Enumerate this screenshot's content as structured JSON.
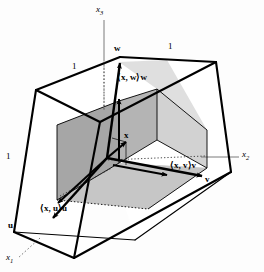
{
  "figure": {
    "axes": [
      {
        "name": "x3-axis-label",
        "text": "x₃",
        "base": "x",
        "sub": "3"
      },
      {
        "name": "x2-axis-label",
        "text": "x₂",
        "base": "x",
        "sub": "2"
      },
      {
        "name": "x1-axis-label",
        "text": "x₁",
        "base": "x",
        "sub": "1"
      }
    ],
    "basis_vectors": [
      {
        "name": "w",
        "label": "w"
      },
      {
        "name": "v",
        "label": "v"
      },
      {
        "name": "u",
        "label": "u"
      }
    ],
    "vector_label": "x",
    "components": [
      {
        "name": "component-w",
        "label": "⟨x, w⟩w"
      },
      {
        "name": "component-v",
        "label": "⟨x, v⟩v"
      },
      {
        "name": "component-u",
        "label": "⟨x, u⟩u"
      }
    ],
    "edge_lengths": [
      {
        "name": "edge-length-top-left",
        "label": "1"
      },
      {
        "name": "edge-length-top-right",
        "label": "1"
      },
      {
        "name": "edge-length-left",
        "label": "1"
      }
    ],
    "colors": {
      "stroke": "#000000",
      "axis": "#6b6b6b",
      "face_dark": "#a6a6a6",
      "face_mid": "#bfbfbf",
      "face_light": "#d9d9d9",
      "background": "#fdfdfd"
    }
  }
}
